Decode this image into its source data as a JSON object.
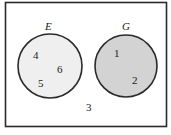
{
  "diagram": {
    "type": "venn",
    "universe": {
      "element": "3",
      "border_color": "#2a2a2a"
    },
    "sets": [
      {
        "name": "E",
        "label_color": "#9a9a9a",
        "fill": "#efefef",
        "stroke": "#2a2a2a",
        "elements": [
          "4",
          "6",
          "5"
        ]
      },
      {
        "name": "G",
        "label_color": "#6a6a6a",
        "fill": "#d3d3d3",
        "stroke": "#2a2a2a",
        "elements": [
          "1",
          "2"
        ]
      }
    ]
  }
}
